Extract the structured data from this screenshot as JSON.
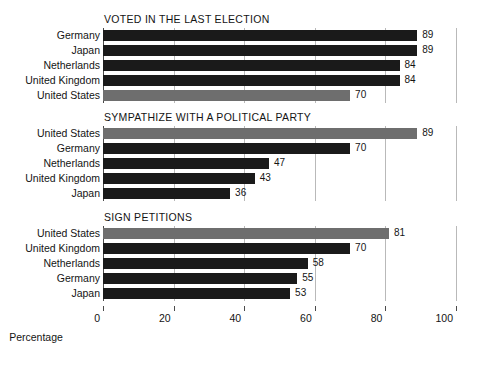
{
  "chart_data": {
    "type": "bar",
    "title": "",
    "xlabel": "Percentage",
    "ylabel": "",
    "xlim": [
      0,
      100
    ],
    "xticks": [
      0,
      20,
      40,
      60,
      80,
      100
    ],
    "grid": "vertical",
    "legend": "none",
    "orientation": "horizontal",
    "colors": {
      "default_bar": "#1a1a1a",
      "highlight_bar": "#6e6e6e",
      "gridline": "#b9b9b9",
      "axis": "#4a4a4a",
      "background": "#ffffff",
      "text": "#141414"
    },
    "highlight_category": "United States",
    "panels": [
      {
        "title": "VOTED IN THE LAST ELECTION",
        "categories": [
          "Germany",
          "Japan",
          "Netherlands",
          "United Kingdom",
          "United States"
        ],
        "values": [
          89,
          89,
          84,
          84,
          70
        ],
        "highlight": [
          false,
          false,
          false,
          false,
          true
        ]
      },
      {
        "title": "SYMPATHIZE WITH A POLITICAL PARTY",
        "categories": [
          "United States",
          "Germany",
          "Netherlands",
          "United Kingdom",
          "Japan"
        ],
        "values": [
          89,
          70,
          47,
          43,
          36
        ],
        "highlight": [
          true,
          false,
          false,
          false,
          false
        ]
      },
      {
        "title": "SIGN PETITIONS",
        "categories": [
          "United States",
          "United Kingdom",
          "Netherlands",
          "Germany",
          "Japan"
        ],
        "values": [
          81,
          70,
          58,
          55,
          53
        ],
        "highlight": [
          true,
          false,
          false,
          false,
          false
        ]
      }
    ]
  },
  "geometry": {
    "plot_left": 103,
    "plot_width": 353,
    "panel_tops": [
      28,
      126,
      226
    ],
    "title_tops": [
      13,
      111,
      211
    ],
    "row_pitch": 15,
    "bar_height": 11,
    "axis_top": 306
  }
}
